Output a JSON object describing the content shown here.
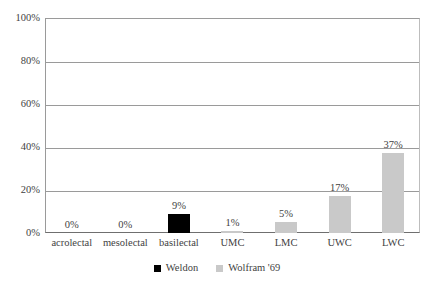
{
  "chart_data": {
    "type": "bar",
    "title": "",
    "subtitle": "",
    "xlabel": "",
    "ylabel": "",
    "ylim": [
      0,
      100
    ],
    "y_ticks": [
      "0%",
      "20%",
      "40%",
      "60%",
      "80%",
      "100%"
    ],
    "y_tick_values": [
      0,
      20,
      40,
      60,
      80,
      100
    ],
    "grid": true,
    "legend_position": "bottom",
    "categories": [
      "acrolectal",
      "mesolectal",
      "basilectal",
      "UMC",
      "LMC",
      "UWC",
      "LWC"
    ],
    "series": [
      {
        "name": "Weldon",
        "color": "#000000",
        "values": [
          0,
          0,
          9,
          null,
          null,
          null,
          null
        ],
        "labels": [
          "0%",
          "0%",
          "9%",
          "",
          "",
          "",
          ""
        ]
      },
      {
        "name": "Wolfram '69",
        "color": "#c9c9c9",
        "values": [
          null,
          null,
          null,
          1,
          5,
          17,
          37
        ],
        "labels": [
          "",
          "",
          "",
          "1%",
          "5%",
          "17%",
          "37%"
        ]
      }
    ],
    "bars": [
      {
        "category": "acrolectal",
        "series": "Weldon",
        "value": 0,
        "label": "0%",
        "color": "#000000"
      },
      {
        "category": "mesolectal",
        "series": "Weldon",
        "value": 0,
        "label": "0%",
        "color": "#000000"
      },
      {
        "category": "basilectal",
        "series": "Weldon",
        "value": 9,
        "label": "9%",
        "color": "#000000"
      },
      {
        "category": "UMC",
        "series": "Wolfram '69",
        "value": 1,
        "label": "1%",
        "color": "#c9c9c9"
      },
      {
        "category": "LMC",
        "series": "Wolfram '69",
        "value": 5,
        "label": "5%",
        "color": "#c9c9c9"
      },
      {
        "category": "UWC",
        "series": "Wolfram '69",
        "value": 17,
        "label": "17%",
        "color": "#c9c9c9"
      },
      {
        "category": "LWC",
        "series": "Wolfram '69",
        "value": 37,
        "label": "37%",
        "color": "#c9c9c9"
      }
    ],
    "legend": [
      {
        "label": "Weldon",
        "color": "#000000"
      },
      {
        "label": "Wolfram '69",
        "color": "#c9c9c9"
      }
    ]
  }
}
